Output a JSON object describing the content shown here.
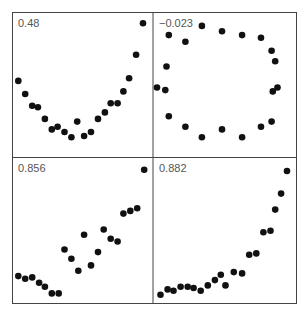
{
  "chart_data": [
    {
      "type": "scatter",
      "title": "0.48",
      "annotation": "0.48",
      "panel": "top-left",
      "points": [
        [
          0.02,
          0.55
        ],
        [
          0.08,
          0.45
        ],
        [
          0.14,
          0.36
        ],
        [
          0.19,
          0.35
        ],
        [
          0.25,
          0.26
        ],
        [
          0.31,
          0.18
        ],
        [
          0.36,
          0.2
        ],
        [
          0.42,
          0.16
        ],
        [
          0.48,
          0.12
        ],
        [
          0.53,
          0.24
        ],
        [
          0.59,
          0.13
        ],
        [
          0.65,
          0.16
        ],
        [
          0.71,
          0.26
        ],
        [
          0.77,
          0.31
        ],
        [
          0.82,
          0.38
        ],
        [
          0.88,
          0.38
        ],
        [
          0.93,
          0.47
        ],
        [
          0.98,
          0.57
        ],
        [
          1.04,
          0.75
        ],
        [
          1.1,
          0.99
        ]
      ]
    },
    {
      "type": "scatter",
      "title": "-0.023",
      "annotation": "−0.023",
      "panel": "top-right",
      "points": [
        [
          0.1,
          0.9
        ],
        [
          0.24,
          0.85
        ],
        [
          0.38,
          0.97
        ],
        [
          0.55,
          0.93
        ],
        [
          0.72,
          0.9
        ],
        [
          0.88,
          0.88
        ],
        [
          0.97,
          0.78
        ],
        [
          1.0,
          0.7
        ],
        [
          0.08,
          0.66
        ],
        [
          0.0,
          0.5
        ],
        [
          0.07,
          0.48
        ],
        [
          1.02,
          0.5
        ],
        [
          0.98,
          0.47
        ],
        [
          0.1,
          0.28
        ],
        [
          0.24,
          0.2
        ],
        [
          0.38,
          0.12
        ],
        [
          0.55,
          0.18
        ],
        [
          0.72,
          0.12
        ],
        [
          0.88,
          0.2
        ],
        [
          0.97,
          0.24
        ]
      ]
    },
    {
      "type": "scatter",
      "title": "0.856",
      "annotation": "0.856",
      "panel": "bottom-left",
      "points": [
        [
          0.02,
          0.18
        ],
        [
          0.08,
          0.16
        ],
        [
          0.14,
          0.17
        ],
        [
          0.2,
          0.13
        ],
        [
          0.25,
          0.1
        ],
        [
          0.31,
          0.05
        ],
        [
          0.37,
          0.05
        ],
        [
          0.42,
          0.38
        ],
        [
          0.48,
          0.31
        ],
        [
          0.54,
          0.22
        ],
        [
          0.59,
          0.49
        ],
        [
          0.65,
          0.26
        ],
        [
          0.71,
          0.36
        ],
        [
          0.76,
          0.53
        ],
        [
          0.82,
          0.46
        ],
        [
          0.88,
          0.44
        ],
        [
          0.93,
          0.65
        ],
        [
          0.99,
          0.67
        ],
        [
          1.05,
          0.69
        ],
        [
          1.11,
          0.98
        ]
      ]
    },
    {
      "type": "scatter",
      "title": "0.882",
      "annotation": "0.882",
      "panel": "bottom-right",
      "points": [
        [
          0.03,
          0.04
        ],
        [
          0.09,
          0.08
        ],
        [
          0.14,
          0.07
        ],
        [
          0.2,
          0.1
        ],
        [
          0.26,
          0.1
        ],
        [
          0.31,
          0.09
        ],
        [
          0.37,
          0.07
        ],
        [
          0.43,
          0.11
        ],
        [
          0.49,
          0.15
        ],
        [
          0.54,
          0.19
        ],
        [
          0.58,
          0.11
        ],
        [
          0.65,
          0.21
        ],
        [
          0.72,
          0.2
        ],
        [
          0.78,
          0.34
        ],
        [
          0.84,
          0.35
        ],
        [
          0.9,
          0.51
        ],
        [
          0.96,
          0.52
        ],
        [
          1.0,
          0.68
        ],
        [
          1.05,
          0.8
        ],
        [
          1.1,
          0.97
        ]
      ]
    }
  ],
  "panels": {
    "top_left": {
      "label": "0.48"
    },
    "top_right": {
      "label": "−0.023"
    },
    "bottom_left": {
      "label": "0.856"
    },
    "bottom_right": {
      "label": "0.882"
    }
  },
  "style": {
    "dot_color": "#111111",
    "frame_color": "#444444",
    "label_color": "#555555"
  }
}
